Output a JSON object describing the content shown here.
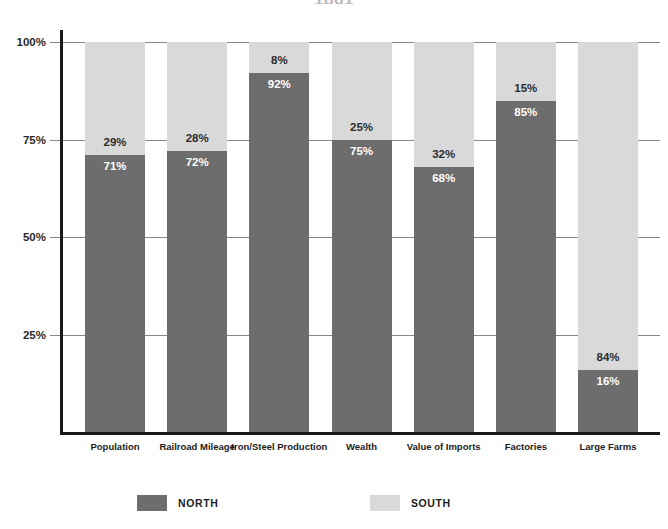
{
  "chart_data": {
    "type": "bar",
    "subtype": "stacked-100-percent",
    "title": "",
    "xlabel": "",
    "ylabel": "",
    "ylim": [
      0,
      100
    ],
    "yticks": [
      "25%",
      "50%",
      "75%",
      "100%"
    ],
    "ytick_values": [
      25,
      50,
      75,
      100
    ],
    "grid": true,
    "legend_position": "bottom",
    "categories": [
      "Population",
      "Railroad Mileage",
      "Iron/Steel Production",
      "Wealth",
      "Value of Imports",
      "Factories",
      "Large Farms"
    ],
    "series": [
      {
        "name": "NORTH",
        "color": "#6d6d6d",
        "values": [
          71,
          72,
          92,
          75,
          68,
          85,
          16
        ],
        "labels": [
          "71%",
          "72%",
          "92%",
          "75%",
          "68%",
          "85%",
          "16%"
        ]
      },
      {
        "name": "SOUTH",
        "color": "#d9d9d9",
        "values": [
          29,
          28,
          8,
          25,
          32,
          15,
          84
        ],
        "labels": [
          "29%",
          "28%",
          "8%",
          "25%",
          "32%",
          "15%",
          "84%"
        ]
      }
    ]
  },
  "axis": {
    "y_tick_labels": [
      "100%",
      "75%",
      "50%",
      "25%"
    ]
  },
  "legend": {
    "items": [
      {
        "label": "NORTH",
        "color": "#6d6d6d"
      },
      {
        "label": "SOUTH",
        "color": "#d9d9d9"
      }
    ]
  },
  "title_sliver": {
    "text": "1861"
  }
}
